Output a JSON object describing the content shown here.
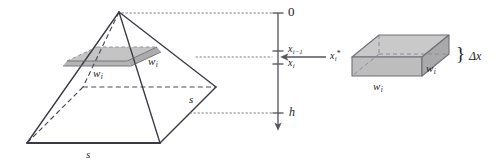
{
  "figure": {
    "colors": {
      "stroke": "#3a3a44",
      "stroke_light": "#6e6e78",
      "dashed": "#4a4a55",
      "dotted": "#7a7a85",
      "slab_fill": "#b9b9b9",
      "slab_fill_top": "#c6c6c6",
      "box_top_fill": "#c9c9c9",
      "box_front_fill": "#bdbdbd",
      "box_side_fill": "#a9a9a9",
      "axis": "#55555f",
      "text": "#1c1c1c",
      "background": "#ffffff"
    },
    "pyramid": {
      "name": "square-pyramid",
      "apex": [
        119,
        12
      ],
      "base_front_left": [
        27,
        143
      ],
      "base_front_right": [
        160,
        143
      ],
      "base_back_right": [
        216,
        87
      ],
      "base_back_left": [
        83,
        87
      ],
      "base_label_front": "s",
      "base_label_right": "s"
    },
    "slab": {
      "name": "shaded-cross-section-slab",
      "label_front": "w",
      "label_front_sub": "i",
      "label_right": "w",
      "label_right_sub": "i",
      "top_y": 47,
      "bottom_y": 62
    },
    "axis": {
      "name": "depth-axis",
      "x": 278,
      "top_y": 13,
      "bottom_y": 127,
      "ticks": [
        {
          "label": "0",
          "sub": "",
          "y": 13,
          "type": "plain"
        },
        {
          "label": "x",
          "sub": "i−1",
          "y": 51,
          "type": "math"
        },
        {
          "label": "x",
          "sub": "i",
          "y": 64,
          "type": "math"
        },
        {
          "label": "h",
          "sub": "",
          "y": 113,
          "type": "math"
        }
      ],
      "sample_point": {
        "label": "x",
        "sub": "i",
        "sup": "*",
        "arrow_from_x": 326,
        "arrow_to_x": 282,
        "y": 57
      }
    },
    "guides": {
      "name": "dotted-guide-lines",
      "lines": [
        {
          "y": 13,
          "x1": 122,
          "x2": 272
        },
        {
          "y": 57,
          "x1": 196,
          "x2": 272
        },
        {
          "y": 113,
          "x1": 190,
          "x2": 272
        }
      ]
    },
    "box": {
      "name": "slab-prism-diagram",
      "label_front": "w",
      "label_front_sub": "i",
      "label_right": "w",
      "label_right_sub": "i",
      "brace": "}",
      "thickness_label": "Δx"
    }
  }
}
